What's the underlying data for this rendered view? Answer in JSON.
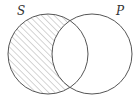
{
  "diagram": {
    "type": "venn",
    "sets": [
      {
        "label": "S",
        "cx": 48,
        "cy": 54,
        "r": 40
      },
      {
        "label": "P",
        "cx": 92,
        "cy": 54,
        "r": 40
      }
    ],
    "shaded_region": "S minus P",
    "shading": "diagonal hatch",
    "colors": {
      "outline": "#555555",
      "hatch": "#aaaaaa",
      "background": "#ffffff",
      "label": "#333333"
    }
  }
}
